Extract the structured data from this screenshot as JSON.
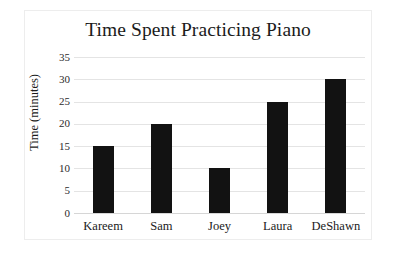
{
  "chart_data": {
    "type": "bar",
    "title": "Time Spent Practicing Piano",
    "xlabel": "",
    "ylabel": "Time (minutes)",
    "categories": [
      "Kareem",
      "Sam",
      "Joey",
      "Laura",
      "DeShawn"
    ],
    "values": [
      15,
      20,
      10,
      25,
      30
    ],
    "yticks": [
      0,
      5,
      10,
      15,
      20,
      25,
      30,
      35
    ],
    "ylim": [
      0,
      35
    ],
    "grid": true,
    "legend": false,
    "bar_color": "#121212",
    "grid_color": "#e4e4e4",
    "background_color": "#ffffff",
    "text_color": "#1b1b1b"
  }
}
